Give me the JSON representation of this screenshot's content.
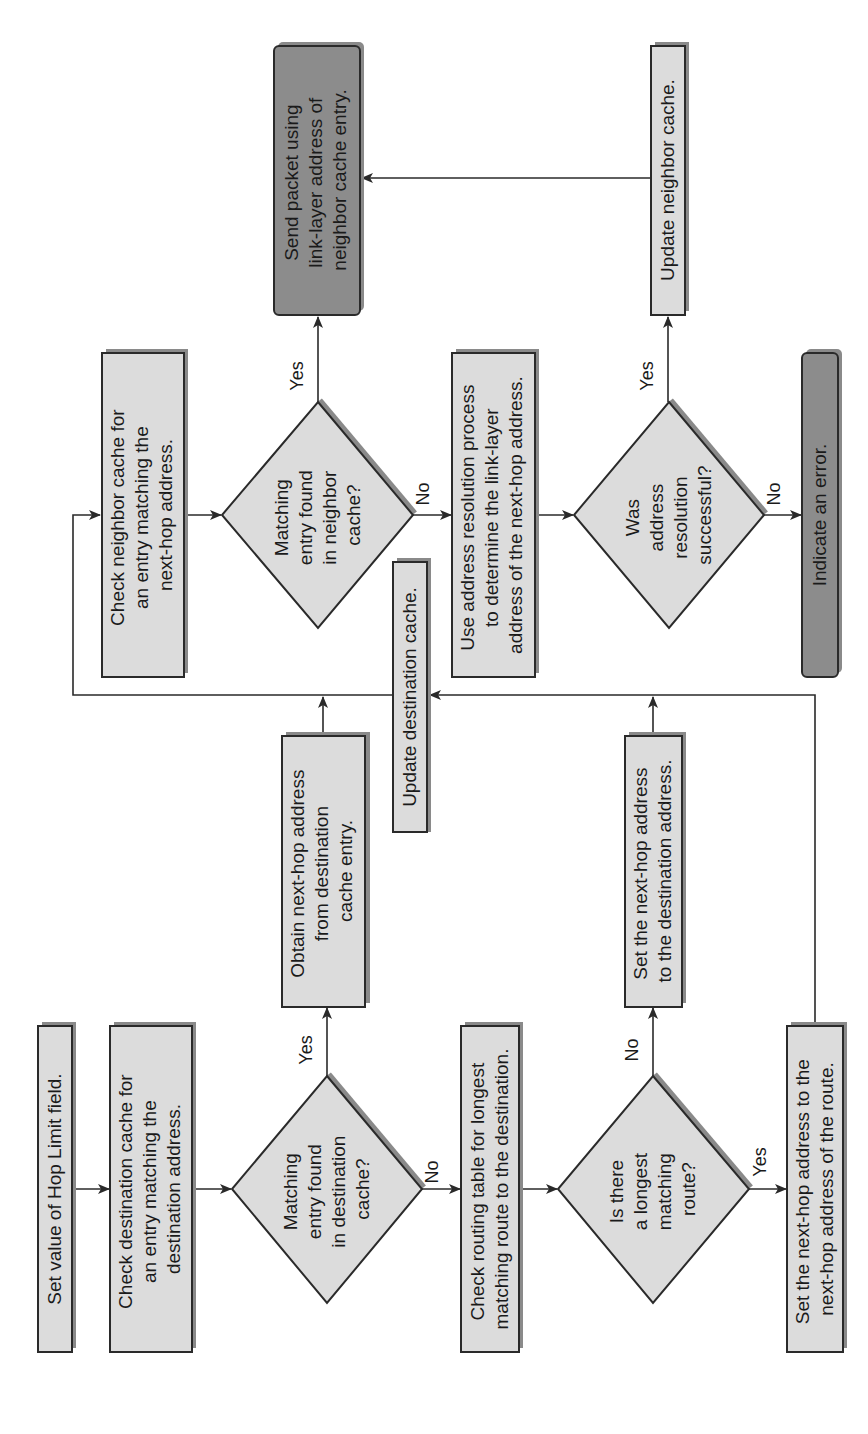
{
  "diagram": {
    "orientation": "rotated-90-ccw",
    "colors": {
      "process_fill": "#dcdcdc",
      "terminal_fill": "#8c8c8c",
      "shadow": "#8a8a8a",
      "stroke": "#2a2a2a",
      "background": "#ffffff"
    },
    "nodes": {
      "set_hop_limit": {
        "type": "process",
        "lines": [
          "Set value of Hop Limit field."
        ]
      },
      "check_dest_cache": {
        "type": "process",
        "lines": [
          "Check destination cache for",
          "an entry matching the",
          "destination address."
        ]
      },
      "dest_cache_found": {
        "type": "decision",
        "lines": [
          "Matching",
          "entry found",
          "in destination",
          "cache?"
        ]
      },
      "obtain_next_hop": {
        "type": "process",
        "lines": [
          "Obtain next-hop address",
          "from destination",
          "cache entry."
        ]
      },
      "check_routing_table": {
        "type": "process",
        "lines": [
          "Check routing table for longest",
          "matching route to the destination."
        ]
      },
      "longest_route": {
        "type": "decision",
        "lines": [
          "Is there",
          "a longest",
          "matching",
          "route?"
        ]
      },
      "set_next_hop_dest": {
        "type": "process",
        "lines": [
          "Set the next-hop address",
          "to the destination address."
        ]
      },
      "set_next_hop_route": {
        "type": "process",
        "lines": [
          "Set the next-hop address to the",
          "next-hop address of the route."
        ]
      },
      "update_dest_cache": {
        "type": "process",
        "lines": [
          "Update destination cache."
        ]
      },
      "check_neighbor_cache": {
        "type": "process",
        "lines": [
          "Check neighbor cache for",
          "an entry matching the",
          "next-hop address."
        ]
      },
      "neighbor_found": {
        "type": "decision",
        "lines": [
          "Matching",
          "entry found",
          "in neighbor",
          "cache?"
        ]
      },
      "address_resolution": {
        "type": "process",
        "lines": [
          "Use address resolution process",
          "to determine the link-layer",
          "address of the next-hop address."
        ]
      },
      "resolution_success": {
        "type": "decision",
        "lines": [
          "Was",
          "address",
          "resolution",
          "successful?"
        ]
      },
      "indicate_error": {
        "type": "terminal",
        "lines": [
          "Indicate an error."
        ]
      },
      "send_packet": {
        "type": "terminal",
        "lines": [
          "Send packet using",
          "link-layer address of",
          "neighbor cache entry."
        ]
      },
      "update_neighbor_cache": {
        "type": "process",
        "lines": [
          "Update neighbor cache."
        ]
      }
    },
    "branch_labels": {
      "d1_yes": "Yes",
      "d1_no": "No",
      "d2_no": "No",
      "d2_yes": "Yes",
      "d3_yes": "Yes",
      "d3_no": "No",
      "d4_yes": "Yes",
      "d4_no": "No"
    },
    "edges": [
      [
        "set_hop_limit",
        "check_dest_cache",
        ""
      ],
      [
        "check_dest_cache",
        "dest_cache_found",
        ""
      ],
      [
        "dest_cache_found",
        "obtain_next_hop",
        "Yes"
      ],
      [
        "dest_cache_found",
        "check_routing_table",
        "No"
      ],
      [
        "check_routing_table",
        "longest_route",
        ""
      ],
      [
        "longest_route",
        "set_next_hop_dest",
        "No"
      ],
      [
        "longest_route",
        "set_next_hop_route",
        "Yes"
      ],
      [
        "obtain_next_hop",
        "check_neighbor_cache",
        ""
      ],
      [
        "set_next_hop_dest",
        "update_dest_cache",
        ""
      ],
      [
        "set_next_hop_route",
        "update_dest_cache",
        ""
      ],
      [
        "update_dest_cache",
        "check_neighbor_cache",
        ""
      ],
      [
        "check_neighbor_cache",
        "neighbor_found",
        ""
      ],
      [
        "neighbor_found",
        "send_packet",
        "Yes"
      ],
      [
        "neighbor_found",
        "address_resolution",
        "No"
      ],
      [
        "address_resolution",
        "resolution_success",
        ""
      ],
      [
        "resolution_success",
        "update_neighbor_cache",
        "Yes"
      ],
      [
        "resolution_success",
        "indicate_error",
        "No"
      ],
      [
        "update_neighbor_cache",
        "send_packet",
        ""
      ]
    ]
  }
}
